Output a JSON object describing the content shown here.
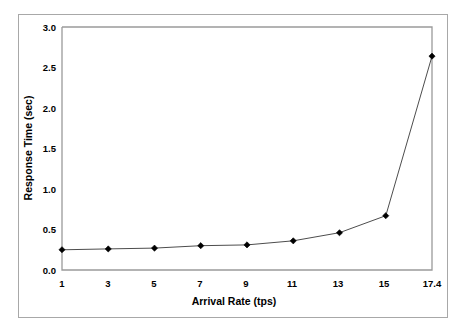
{
  "figure": {
    "background_color": "#ffffff",
    "frame_color": "#a8a8a8",
    "axis_color": "#9a9a9a",
    "series_color": "#4d4d4d",
    "marker_color": "#000000"
  },
  "chart_data": {
    "type": "line",
    "title": "",
    "xlabel": "Arrival Rate (tps)",
    "ylabel": "Response Time (sec)",
    "x": [
      1,
      3,
      5,
      7,
      9,
      11,
      13,
      15,
      17.4
    ],
    "values": [
      0.25,
      0.26,
      0.27,
      0.3,
      0.31,
      0.36,
      0.46,
      0.67,
      2.64
    ],
    "xtick_labels": [
      "1",
      "3",
      "5",
      "7",
      "9",
      "11",
      "13",
      "15",
      "17.4"
    ],
    "ytick_labels": [
      "0.0",
      "0.5",
      "1.0",
      "1.5",
      "2.0",
      "2.5",
      "3.0"
    ],
    "ytick_values": [
      0.0,
      0.5,
      1.0,
      1.5,
      2.0,
      2.5,
      3.0
    ],
    "ylim": [
      0.0,
      3.0
    ],
    "xlim": [
      1,
      17.4
    ],
    "grid": false,
    "legend": false,
    "marker": "diamond",
    "series": [
      {
        "name": "Response Time",
        "values": [
          0.25,
          0.26,
          0.27,
          0.3,
          0.31,
          0.36,
          0.46,
          0.67,
          2.64
        ]
      }
    ]
  },
  "labels": {
    "y_axis_title": "Response Time (sec)",
    "x_axis_title": "Arrival Rate (tps)",
    "y_ticks": {
      "t0": "0.0",
      "t1": "0.5",
      "t2": "1.0",
      "t3": "1.5",
      "t4": "2.0",
      "t5": "2.5",
      "t6": "3.0"
    },
    "x_ticks": {
      "t0": "1",
      "t1": "3",
      "t2": "5",
      "t3": "7",
      "t4": "9",
      "t5": "11",
      "t6": "13",
      "t7": "15",
      "t8": "17.4"
    }
  }
}
